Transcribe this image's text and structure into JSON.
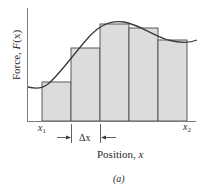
{
  "figure": {
    "caption": "(a)",
    "y_axis_label_prefix": "Force, ",
    "y_axis_label_func": "F",
    "y_axis_label_arg": "(x)",
    "x_axis_label_prefix": "Position, ",
    "x_axis_label_var": "x",
    "x1_label": "x",
    "x1_sub": "1",
    "x2_label": "x",
    "x2_sub": "2",
    "delta_label": "Δx",
    "colors": {
      "rect_fill": "#dcdcdc",
      "rect_stroke": "#4a4a4a",
      "curve": "#3a3a3a",
      "axis": "#7a7a7a"
    },
    "rectangles": [
      {
        "x": 42,
        "top": 82,
        "width": 29
      },
      {
        "x": 71,
        "top": 48,
        "width": 29
      },
      {
        "x": 100,
        "top": 24,
        "width": 29
      },
      {
        "x": 129,
        "top": 28,
        "width": 29
      },
      {
        "x": 158,
        "top": 40,
        "width": 29
      }
    ]
  }
}
